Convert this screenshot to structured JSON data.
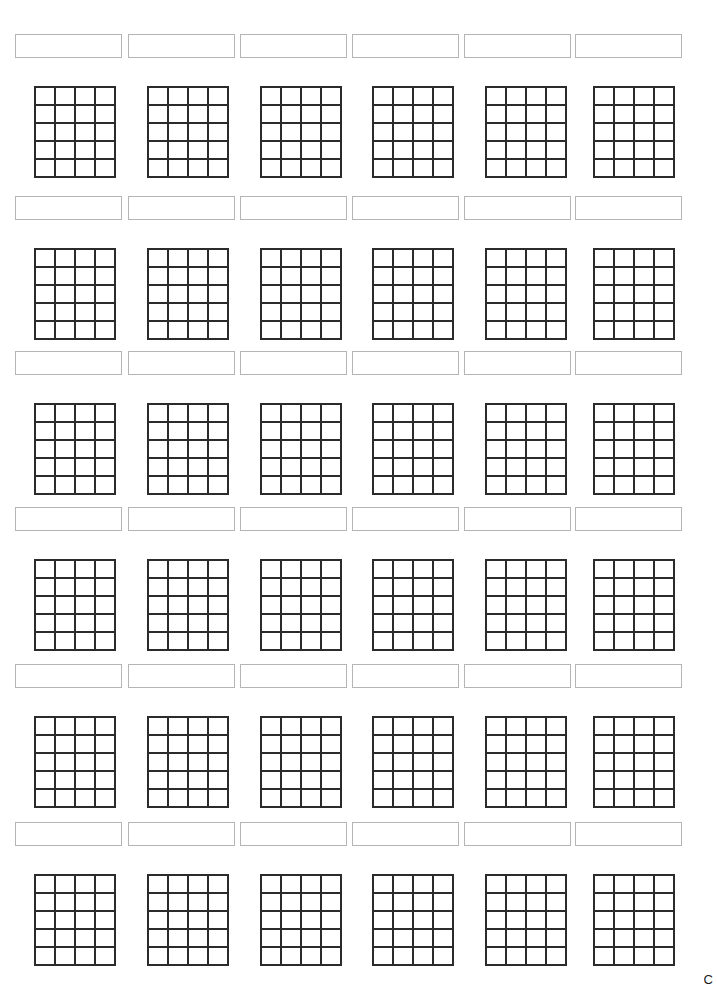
{
  "page": {
    "kind": "worksheet",
    "background_color": "#ffffff",
    "width": 717,
    "height": 980,
    "content_text": "",
    "edge_artifact_glyph": "C"
  },
  "style": {
    "label_box_border_color": "#b5b5b5",
    "label_box_fill_color": "#ffffff",
    "grid_line_color": "#2b2b2b",
    "grid_cell_fill_color": "#ffffff"
  },
  "layout": {
    "block_rows": 6,
    "columns_per_row": 6,
    "grid_columns": 4,
    "grid_rows": 5,
    "row_tops": [
      34,
      196,
      351,
      507,
      664,
      822
    ],
    "grid_offset_from_label": 52
  },
  "blocks": [
    {
      "row_index": 1,
      "items": [
        {
          "label_value": "",
          "label_placeholder": "",
          "grid_values": [
            "",
            "",
            "",
            "",
            "",
            "",
            "",
            "",
            "",
            "",
            "",
            "",
            "",
            "",
            "",
            "",
            "",
            "",
            "",
            ""
          ]
        },
        {
          "label_value": "",
          "label_placeholder": "",
          "grid_values": [
            "",
            "",
            "",
            "",
            "",
            "",
            "",
            "",
            "",
            "",
            "",
            "",
            "",
            "",
            "",
            "",
            "",
            "",
            "",
            ""
          ]
        },
        {
          "label_value": "",
          "label_placeholder": "",
          "grid_values": [
            "",
            "",
            "",
            "",
            "",
            "",
            "",
            "",
            "",
            "",
            "",
            "",
            "",
            "",
            "",
            "",
            "",
            "",
            "",
            ""
          ]
        },
        {
          "label_value": "",
          "label_placeholder": "",
          "grid_values": [
            "",
            "",
            "",
            "",
            "",
            "",
            "",
            "",
            "",
            "",
            "",
            "",
            "",
            "",
            "",
            "",
            "",
            "",
            "",
            ""
          ]
        },
        {
          "label_value": "",
          "label_placeholder": "",
          "grid_values": [
            "",
            "",
            "",
            "",
            "",
            "",
            "",
            "",
            "",
            "",
            "",
            "",
            "",
            "",
            "",
            "",
            "",
            "",
            "",
            ""
          ]
        },
        {
          "label_value": "",
          "label_placeholder": "",
          "grid_values": [
            "",
            "",
            "",
            "",
            "",
            "",
            "",
            "",
            "",
            "",
            "",
            "",
            "",
            "",
            "",
            "",
            "",
            "",
            "",
            ""
          ]
        }
      ]
    },
    {
      "row_index": 2,
      "items": [
        {
          "label_value": "",
          "label_placeholder": "",
          "grid_values": [
            "",
            "",
            "",
            "",
            "",
            "",
            "",
            "",
            "",
            "",
            "",
            "",
            "",
            "",
            "",
            "",
            "",
            "",
            "",
            ""
          ]
        },
        {
          "label_value": "",
          "label_placeholder": "",
          "grid_values": [
            "",
            "",
            "",
            "",
            "",
            "",
            "",
            "",
            "",
            "",
            "",
            "",
            "",
            "",
            "",
            "",
            "",
            "",
            "",
            ""
          ]
        },
        {
          "label_value": "",
          "label_placeholder": "",
          "grid_values": [
            "",
            "",
            "",
            "",
            "",
            "",
            "",
            "",
            "",
            "",
            "",
            "",
            "",
            "",
            "",
            "",
            "",
            "",
            "",
            ""
          ]
        },
        {
          "label_value": "",
          "label_placeholder": "",
          "grid_values": [
            "",
            "",
            "",
            "",
            "",
            "",
            "",
            "",
            "",
            "",
            "",
            "",
            "",
            "",
            "",
            "",
            "",
            "",
            "",
            ""
          ]
        },
        {
          "label_value": "",
          "label_placeholder": "",
          "grid_values": [
            "",
            "",
            "",
            "",
            "",
            "",
            "",
            "",
            "",
            "",
            "",
            "",
            "",
            "",
            "",
            "",
            "",
            "",
            "",
            ""
          ]
        },
        {
          "label_value": "",
          "label_placeholder": "",
          "grid_values": [
            "",
            "",
            "",
            "",
            "",
            "",
            "",
            "",
            "",
            "",
            "",
            "",
            "",
            "",
            "",
            "",
            "",
            "",
            "",
            ""
          ]
        }
      ]
    },
    {
      "row_index": 3,
      "items": [
        {
          "label_value": "",
          "label_placeholder": "",
          "grid_values": [
            "",
            "",
            "",
            "",
            "",
            "",
            "",
            "",
            "",
            "",
            "",
            "",
            "",
            "",
            "",
            "",
            "",
            "",
            "",
            ""
          ]
        },
        {
          "label_value": "",
          "label_placeholder": "",
          "grid_values": [
            "",
            "",
            "",
            "",
            "",
            "",
            "",
            "",
            "",
            "",
            "",
            "",
            "",
            "",
            "",
            "",
            "",
            "",
            "",
            ""
          ]
        },
        {
          "label_value": "",
          "label_placeholder": "",
          "grid_values": [
            "",
            "",
            "",
            "",
            "",
            "",
            "",
            "",
            "",
            "",
            "",
            "",
            "",
            "",
            "",
            "",
            "",
            "",
            "",
            ""
          ]
        },
        {
          "label_value": "",
          "label_placeholder": "",
          "grid_values": [
            "",
            "",
            "",
            "",
            "",
            "",
            "",
            "",
            "",
            "",
            "",
            "",
            "",
            "",
            "",
            "",
            "",
            "",
            "",
            ""
          ]
        },
        {
          "label_value": "",
          "label_placeholder": "",
          "grid_values": [
            "",
            "",
            "",
            "",
            "",
            "",
            "",
            "",
            "",
            "",
            "",
            "",
            "",
            "",
            "",
            "",
            "",
            "",
            "",
            ""
          ]
        },
        {
          "label_value": "",
          "label_placeholder": "",
          "grid_values": [
            "",
            "",
            "",
            "",
            "",
            "",
            "",
            "",
            "",
            "",
            "",
            "",
            "",
            "",
            "",
            "",
            "",
            "",
            "",
            ""
          ]
        }
      ]
    },
    {
      "row_index": 4,
      "items": [
        {
          "label_value": "",
          "label_placeholder": "",
          "grid_values": [
            "",
            "",
            "",
            "",
            "",
            "",
            "",
            "",
            "",
            "",
            "",
            "",
            "",
            "",
            "",
            "",
            "",
            "",
            "",
            ""
          ]
        },
        {
          "label_value": "",
          "label_placeholder": "",
          "grid_values": [
            "",
            "",
            "",
            "",
            "",
            "",
            "",
            "",
            "",
            "",
            "",
            "",
            "",
            "",
            "",
            "",
            "",
            "",
            "",
            ""
          ]
        },
        {
          "label_value": "",
          "label_placeholder": "",
          "grid_values": [
            "",
            "",
            "",
            "",
            "",
            "",
            "",
            "",
            "",
            "",
            "",
            "",
            "",
            "",
            "",
            "",
            "",
            "",
            "",
            ""
          ]
        },
        {
          "label_value": "",
          "label_placeholder": "",
          "grid_values": [
            "",
            "",
            "",
            "",
            "",
            "",
            "",
            "",
            "",
            "",
            "",
            "",
            "",
            "",
            "",
            "",
            "",
            "",
            "",
            ""
          ]
        },
        {
          "label_value": "",
          "label_placeholder": "",
          "grid_values": [
            "",
            "",
            "",
            "",
            "",
            "",
            "",
            "",
            "",
            "",
            "",
            "",
            "",
            "",
            "",
            "",
            "",
            "",
            "",
            ""
          ]
        },
        {
          "label_value": "",
          "label_placeholder": "",
          "grid_values": [
            "",
            "",
            "",
            "",
            "",
            "",
            "",
            "",
            "",
            "",
            "",
            "",
            "",
            "",
            "",
            "",
            "",
            "",
            "",
            ""
          ]
        }
      ]
    },
    {
      "row_index": 5,
      "items": [
        {
          "label_value": "",
          "label_placeholder": "",
          "grid_values": [
            "",
            "",
            "",
            "",
            "",
            "",
            "",
            "",
            "",
            "",
            "",
            "",
            "",
            "",
            "",
            "",
            "",
            "",
            "",
            ""
          ]
        },
        {
          "label_value": "",
          "label_placeholder": "",
          "grid_values": [
            "",
            "",
            "",
            "",
            "",
            "",
            "",
            "",
            "",
            "",
            "",
            "",
            "",
            "",
            "",
            "",
            "",
            "",
            "",
            ""
          ]
        },
        {
          "label_value": "",
          "label_placeholder": "",
          "grid_values": [
            "",
            "",
            "",
            "",
            "",
            "",
            "",
            "",
            "",
            "",
            "",
            "",
            "",
            "",
            "",
            "",
            "",
            "",
            "",
            ""
          ]
        },
        {
          "label_value": "",
          "label_placeholder": "",
          "grid_values": [
            "",
            "",
            "",
            "",
            "",
            "",
            "",
            "",
            "",
            "",
            "",
            "",
            "",
            "",
            "",
            "",
            "",
            "",
            "",
            ""
          ]
        },
        {
          "label_value": "",
          "label_placeholder": "",
          "grid_values": [
            "",
            "",
            "",
            "",
            "",
            "",
            "",
            "",
            "",
            "",
            "",
            "",
            "",
            "",
            "",
            "",
            "",
            "",
            "",
            ""
          ]
        },
        {
          "label_value": "",
          "label_placeholder": "",
          "grid_values": [
            "",
            "",
            "",
            "",
            "",
            "",
            "",
            "",
            "",
            "",
            "",
            "",
            "",
            "",
            "",
            "",
            "",
            "",
            "",
            ""
          ]
        }
      ]
    },
    {
      "row_index": 6,
      "items": [
        {
          "label_value": "",
          "label_placeholder": "",
          "grid_values": [
            "",
            "",
            "",
            "",
            "",
            "",
            "",
            "",
            "",
            "",
            "",
            "",
            "",
            "",
            "",
            "",
            "",
            "",
            "",
            ""
          ]
        },
        {
          "label_value": "",
          "label_placeholder": "",
          "grid_values": [
            "",
            "",
            "",
            "",
            "",
            "",
            "",
            "",
            "",
            "",
            "",
            "",
            "",
            "",
            "",
            "",
            "",
            "",
            "",
            ""
          ]
        },
        {
          "label_value": "",
          "label_placeholder": "",
          "grid_values": [
            "",
            "",
            "",
            "",
            "",
            "",
            "",
            "",
            "",
            "",
            "",
            "",
            "",
            "",
            "",
            "",
            "",
            "",
            "",
            ""
          ]
        },
        {
          "label_value": "",
          "label_placeholder": "",
          "grid_values": [
            "",
            "",
            "",
            "",
            "",
            "",
            "",
            "",
            "",
            "",
            "",
            "",
            "",
            "",
            "",
            "",
            "",
            "",
            "",
            ""
          ]
        },
        {
          "label_value": "",
          "label_placeholder": "",
          "grid_values": [
            "",
            "",
            "",
            "",
            "",
            "",
            "",
            "",
            "",
            "",
            "",
            "",
            "",
            "",
            "",
            "",
            "",
            "",
            "",
            ""
          ]
        },
        {
          "label_value": "",
          "label_placeholder": "",
          "grid_values": [
            "",
            "",
            "",
            "",
            "",
            "",
            "",
            "",
            "",
            "",
            "",
            "",
            "",
            "",
            "",
            "",
            "",
            "",
            "",
            ""
          ]
        }
      ]
    }
  ]
}
